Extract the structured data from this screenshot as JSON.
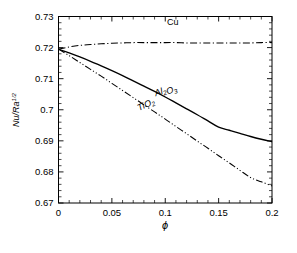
{
  "chart_data": {
    "type": "line",
    "title": "",
    "xlabel": "ϕ",
    "ylabel": "Nu/Ra",
    "ylabel_sup": "1/2",
    "xlim": [
      0,
      0.2
    ],
    "ylim": [
      0.67,
      0.73
    ],
    "xticks": [
      0,
      0.05,
      0.1,
      0.15,
      0.2
    ],
    "xticklabels": [
      "0",
      "0.05",
      "0.1",
      "0.15",
      "0.2"
    ],
    "yticks": [
      0.67,
      0.68,
      0.69,
      0.7,
      0.71,
      0.72,
      0.73
    ],
    "yticklabels": [
      "0.67",
      "0.68",
      "0.69",
      "0.7",
      "0.71",
      "0.72",
      "0.73"
    ],
    "x_minor_count": 4,
    "y_minor_count": 4,
    "grid": false,
    "legend_position": "inline-labels",
    "series": [
      {
        "name": "Cu",
        "label": "Cu",
        "linestyle": "dash-dot",
        "color": "#000000",
        "label_x": 0.107,
        "label_y": 0.7273,
        "label_rotation": 0,
        "x": [
          0,
          0.01,
          0.02,
          0.03,
          0.04,
          0.05,
          0.06,
          0.07,
          0.08,
          0.09,
          0.1,
          0.11,
          0.12,
          0.13,
          0.14,
          0.15,
          0.16,
          0.17,
          0.18,
          0.19,
          0.2
        ],
        "y": [
          0.7195,
          0.7202,
          0.7207,
          0.721,
          0.7212,
          0.7214,
          0.7215,
          0.7216,
          0.7216,
          0.7216,
          0.7216,
          0.7216,
          0.7215,
          0.7215,
          0.7215,
          0.7215,
          0.7215,
          0.7215,
          0.7215,
          0.7216,
          0.7216
        ]
      },
      {
        "name": "Al2O3",
        "label": "Al₂O₃",
        "linestyle": "solid",
        "color": "#000000",
        "label_x": 0.101,
        "label_y": 0.7055,
        "label_rotation": -19,
        "x": [
          0,
          0.01,
          0.02,
          0.03,
          0.04,
          0.05,
          0.06,
          0.07,
          0.08,
          0.09,
          0.1,
          0.11,
          0.12,
          0.13,
          0.14,
          0.15,
          0.16,
          0.17,
          0.18,
          0.19,
          0.2
        ],
        "y": [
          0.7195,
          0.7183,
          0.717,
          0.7156,
          0.7141,
          0.7126,
          0.711,
          0.7093,
          0.7076,
          0.7059,
          0.7041,
          0.7022,
          0.7003,
          0.6984,
          0.6964,
          0.6944,
          0.6934,
          0.6924,
          0.6914,
          0.6905,
          0.6897
        ]
      },
      {
        "name": "TiO2",
        "label": "TiO₂",
        "linestyle": "dash-dot-dot",
        "color": "#000000",
        "label_x": 0.083,
        "label_y": 0.7008,
        "label_rotation": -25,
        "x": [
          0,
          0.01,
          0.02,
          0.03,
          0.04,
          0.05,
          0.06,
          0.07,
          0.08,
          0.09,
          0.1,
          0.11,
          0.12,
          0.13,
          0.14,
          0.15,
          0.16,
          0.17,
          0.18,
          0.19,
          0.2
        ],
        "y": [
          0.7195,
          0.7174,
          0.7152,
          0.713,
          0.7108,
          0.7085,
          0.7062,
          0.7039,
          0.7016,
          0.6993,
          0.697,
          0.6946,
          0.6923,
          0.6899,
          0.6876,
          0.6852,
          0.6829,
          0.6805,
          0.6782,
          0.6768,
          0.6755
        ]
      }
    ]
  }
}
